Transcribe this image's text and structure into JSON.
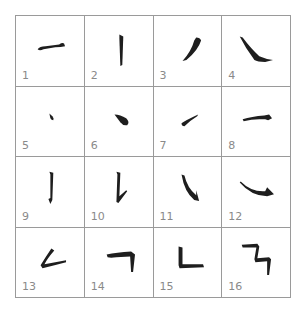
{
  "colors": {
    "ink": "#1e1e1e",
    "grid": "#9a9a9a",
    "label": "#8a8a8a"
  },
  "cells": [
    {
      "label": "1",
      "stroke": "horizontal"
    },
    {
      "label": "2",
      "stroke": "vertical"
    },
    {
      "label": "3",
      "stroke": "left-falling"
    },
    {
      "label": "4",
      "stroke": "right-falling"
    },
    {
      "label": "5",
      "stroke": "dot-small"
    },
    {
      "label": "6",
      "stroke": "dot-large"
    },
    {
      "label": "7",
      "stroke": "rising"
    },
    {
      "label": "8",
      "stroke": "horizontal-hooked"
    },
    {
      "label": "9",
      "stroke": "vertical-hook"
    },
    {
      "label": "10",
      "stroke": "vertical-rising"
    },
    {
      "label": "11",
      "stroke": "curved-hook"
    },
    {
      "label": "12",
      "stroke": "reclining-hook"
    },
    {
      "label": "13",
      "stroke": "left-falling-dot"
    },
    {
      "label": "14",
      "stroke": "horizontal-turn"
    },
    {
      "label": "15",
      "stroke": "vertical-turn"
    },
    {
      "label": "16",
      "stroke": "horizontal-turn-turn"
    }
  ]
}
